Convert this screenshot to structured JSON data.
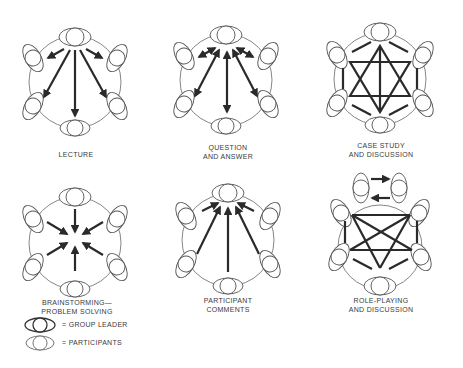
{
  "diagrams": [
    {
      "id": "lecture",
      "label_lines": [
        "LECTURE",
        ""
      ],
      "pattern": "leader-to-participants one-way arrows"
    },
    {
      "id": "question-answer",
      "label_lines": [
        "QUESTION",
        "AND ANSWER"
      ],
      "pattern": "two-way arrows between leader and participants"
    },
    {
      "id": "case-study",
      "label_lines": [
        "CASE STUDY",
        "AND DISCUSSION"
      ],
      "pattern": "all-to-all connections (hexagram)"
    },
    {
      "id": "brainstorming",
      "label_lines": [
        "BRAINSTORMING—",
        "PROBLEM SOLVING"
      ],
      "pattern": "arrows from all to center"
    },
    {
      "id": "participant-comments",
      "label_lines": [
        "PARTICIPANT",
        "COMMENTS"
      ],
      "pattern": "participants-to-leader one-way arrows"
    },
    {
      "id": "role-playing",
      "label_lines": [
        "ROLE-PLAYING",
        "AND DISCUSSION"
      ],
      "pattern": "two role players exchanging, group all-to-all"
    }
  ],
  "legend": {
    "leader": "= GROUP LEADER",
    "participants": "= PARTICIPANTS"
  },
  "colors": {
    "stroke": "#4a4a4a",
    "arrow": "#2a2a2a",
    "text": "#3a3a3a",
    "background": "#ffffff"
  }
}
